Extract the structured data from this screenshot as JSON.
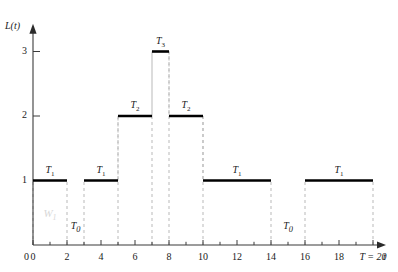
{
  "chart_data": {
    "type": "line",
    "title": "",
    "subtitle": "",
    "xlabel": "t",
    "ylabel": "L(t)",
    "xlim": [
      0,
      20
    ],
    "ylim": [
      0,
      3.4
    ],
    "grid": false,
    "legend_position": "none",
    "x_ticks": [
      0,
      1,
      2,
      3,
      4,
      5,
      6,
      7,
      8,
      9,
      10,
      11,
      12,
      13,
      14,
      15,
      16,
      17,
      18,
      19,
      20
    ],
    "x_tick_labels": [
      "0",
      "",
      "2",
      "",
      "4",
      "",
      "6",
      "",
      "8",
      "",
      "10",
      "",
      "12",
      "",
      "14",
      "",
      "16",
      "",
      "18",
      "",
      "T = 20"
    ],
    "y_ticks": [
      1,
      2,
      3
    ],
    "y_tick_labels": [
      "1",
      "2",
      "3"
    ],
    "steps": [
      {
        "x_start": 0,
        "x_end": 2,
        "level": 1,
        "label": "T",
        "label_sub": "1"
      },
      {
        "x_start": 3,
        "x_end": 5,
        "level": 1,
        "label": "T",
        "label_sub": "1"
      },
      {
        "x_start": 5,
        "x_end": 7,
        "level": 2,
        "label": "T",
        "label_sub": "2"
      },
      {
        "x_start": 7,
        "x_end": 8,
        "level": 3,
        "label": "T",
        "label_sub": "3"
      },
      {
        "x_start": 8,
        "x_end": 10,
        "level": 2,
        "label": "T",
        "label_sub": "2"
      },
      {
        "x_start": 10,
        "x_end": 14,
        "level": 1,
        "label": "T",
        "label_sub": "1"
      },
      {
        "x_start": 16,
        "x_end": 20,
        "level": 1,
        "label": "T",
        "label_sub": "1"
      }
    ],
    "idle_gaps": [
      {
        "x_start": 2,
        "x_end": 3,
        "label": "T",
        "label_sub": "0"
      },
      {
        "x_start": 14,
        "x_end": 16,
        "label": "T",
        "label_sub": "0"
      }
    ],
    "drop_lines": [
      0,
      2,
      3,
      5,
      7,
      8,
      10,
      14,
      16,
      20
    ],
    "annotations": [
      {
        "text": "W",
        "sub": "1",
        "x": 1.0,
        "y": 0.45,
        "style": "watermark"
      }
    ],
    "colors": {
      "step": "#000000",
      "drop_line": "#b9b9b9",
      "axis": "#3b3b3b",
      "text": "#1a1a1a",
      "watermark": "#d8d8d8"
    }
  }
}
